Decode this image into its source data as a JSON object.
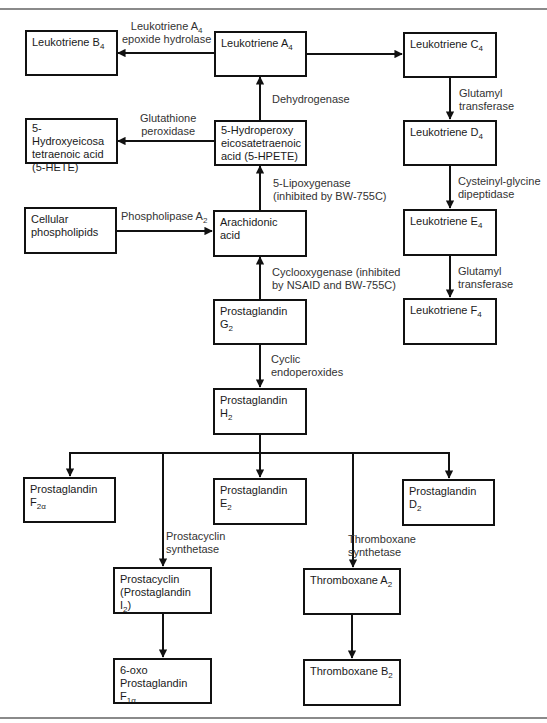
{
  "nodes": {
    "ltb4": {
      "text": "Leukotriene B",
      "sub": "4"
    },
    "lta4": {
      "text": "Leukotriene A",
      "sub": "4"
    },
    "ltc4": {
      "text": "Leukotriene C",
      "sub": "4"
    },
    "ltd4": {
      "text": "Leukotriene D",
      "sub": "4"
    },
    "lte4": {
      "text": "Leukotriene E",
      "sub": "4"
    },
    "ltf4": {
      "text": "Leukotriene F",
      "sub": "4"
    },
    "hete": {
      "lines": [
        "5-Hydroxyeicosa",
        "tetraenoic acid",
        "(5-HETE)"
      ]
    },
    "hpete": {
      "lines": [
        "5-Hydroperoxy",
        "eicosatetraenoic",
        "acid (5-HPETE)"
      ]
    },
    "cellular": {
      "lines": [
        "Cellular",
        "phospholipids"
      ]
    },
    "arachidonic": {
      "lines": [
        "Arachidonic",
        "acid"
      ]
    },
    "pgg2": {
      "text": "Prostaglandin G",
      "sub": "2"
    },
    "pgh2": {
      "text": "Prostaglandin H",
      "sub": "2"
    },
    "pgf2a": {
      "line1": "Prostaglandin",
      "text": "F",
      "sub": "2α"
    },
    "pge2": {
      "text": "Prostaglandin E",
      "sub": "2"
    },
    "pgd2": {
      "text": "Prostaglandin D",
      "sub": "2"
    },
    "prostacyclin": {
      "line1": "Prostacyclin",
      "text": "(Prostaglandin I",
      "sub": "2",
      "after": ")"
    },
    "oxo": {
      "line1": "6-oxo",
      "text": "Prostaglandin F",
      "sub": "1α"
    },
    "txa2": {
      "text": "Thromboxane A",
      "sub": "2"
    },
    "txb2": {
      "text": "Thromboxane B",
      "sub": "2"
    }
  },
  "edges": {
    "lta4_hydrolase": {
      "line1_text": "Leukotriene A",
      "line1_sub": "4",
      "line2": "epoxide hydrolase"
    },
    "glutathione": {
      "lines": [
        "Glutathione",
        "peroxidase"
      ]
    },
    "dehydrogenase": {
      "text": "Dehydrogenase"
    },
    "lipoxygenase": {
      "lines": [
        "5-Lipoxygenase",
        "(inhibited by BW-755C)"
      ]
    },
    "phospholipase": {
      "text": "Phospholipase A",
      "sub": "2"
    },
    "cyclooxygenase": {
      "lines": [
        "Cyclooxygenase (inhibited",
        "by NSAID and BW-755C)"
      ]
    },
    "cyclic": {
      "lines": [
        "Cyclic",
        "endoperoxides"
      ]
    },
    "glutamyl1": {
      "lines": [
        "Glutamyl",
        "transferase"
      ]
    },
    "cysteinyl": {
      "lines": [
        "Cysteinyl-glycine",
        "dipeptidase"
      ]
    },
    "glutamyl2": {
      "lines": [
        "Glutamyl",
        "transferase"
      ]
    },
    "prostacyclin_synth": {
      "lines": [
        "Prostacyclin",
        "synthetase"
      ]
    },
    "thromboxane_synth": {
      "lines": [
        "Thromboxane",
        "synthetase"
      ]
    }
  }
}
